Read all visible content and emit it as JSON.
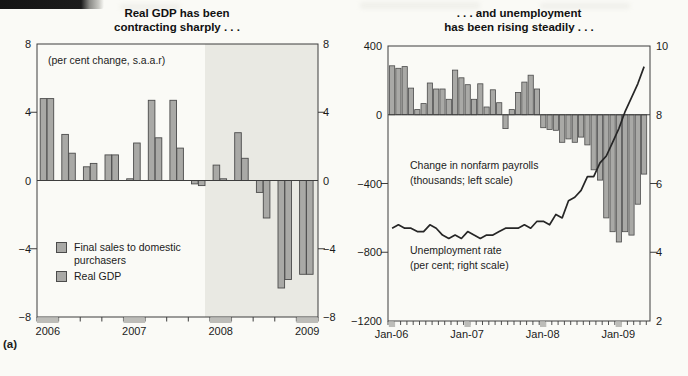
{
  "page": {
    "figure_label": "(a)"
  },
  "chart_data": [
    {
      "type": "bar",
      "panel": "left",
      "title": [
        "Real GDP has been",
        "contracting sharply . . ."
      ],
      "subtitle": "(per cent change, s.a.a.r)",
      "categories": [
        "2006 Q1",
        "2006 Q2",
        "2006 Q3",
        "2006 Q4",
        "2007 Q1",
        "2007 Q2",
        "2007 Q3",
        "2007 Q4",
        "2008 Q1",
        "2008 Q2",
        "2008 Q3",
        "2008 Q4",
        "2009 Q1"
      ],
      "series": [
        {
          "name": "Real GDP",
          "values": [
            4.8,
            2.7,
            0.8,
            1.5,
            0.1,
            4.7,
            4.7,
            -0.2,
            0.9,
            2.8,
            -0.7,
            -6.3,
            -5.5
          ]
        },
        {
          "name": "Final sales to domestic purchasers",
          "values": [
            4.8,
            1.6,
            1.0,
            1.5,
            2.2,
            2.5,
            1.9,
            -0.3,
            0.1,
            1.3,
            -2.2,
            -5.8,
            -5.5
          ]
        }
      ],
      "legend": [
        "Final sales to domestic purchasers",
        "Real GDP"
      ],
      "ylim": [
        -8,
        8
      ],
      "y_tick_values": [
        8,
        4,
        0,
        -4,
        -8
      ],
      "y_tick_labels": [
        "8",
        "4",
        "0",
        "−4",
        "−8"
      ],
      "y_axis_sides": "both",
      "x_axis_labels": [
        "2006",
        "2007",
        "2008",
        "2009"
      ],
      "shaded_span": {
        "from": "2008 Q1",
        "to": "2009 Q1",
        "note": "recession shading"
      },
      "grid": "off"
    },
    {
      "type": "bar+line",
      "panel": "right",
      "title": [
        ". . . and unemployment",
        "has been rising steadily . . ."
      ],
      "categories": [
        "Jan-06",
        "Feb-06",
        "Mar-06",
        "Apr-06",
        "May-06",
        "Jun-06",
        "Jul-06",
        "Aug-06",
        "Sep-06",
        "Oct-06",
        "Nov-06",
        "Dec-06",
        "Jan-07",
        "Feb-07",
        "Mar-07",
        "Apr-07",
        "May-07",
        "Jun-07",
        "Jul-07",
        "Aug-07",
        "Sep-07",
        "Oct-07",
        "Nov-07",
        "Dec-07",
        "Jan-08",
        "Feb-08",
        "Mar-08",
        "Apr-08",
        "May-08",
        "Jun-08",
        "Jul-08",
        "Aug-08",
        "Sep-08",
        "Oct-08",
        "Nov-08",
        "Dec-08",
        "Jan-09",
        "Feb-09",
        "Mar-09",
        "Apr-09",
        "May-09"
      ],
      "bar_series": {
        "name": "Change in nonfarm payrolls (thousands; left scale)",
        "values": [
          285,
          270,
          280,
          155,
          30,
          65,
          185,
          150,
          150,
          90,
          260,
          215,
          175,
          90,
          180,
          45,
          145,
          70,
          -80,
          30,
          130,
          190,
          230,
          150,
          -75,
          -85,
          -90,
          -160,
          -140,
          -160,
          -130,
          -175,
          -320,
          -380,
          -600,
          -680,
          -740,
          -680,
          -700,
          -520,
          -345
        ]
      },
      "line_series": {
        "name": "Unemployment rate (per cent; right scale)",
        "values": [
          4.7,
          4.8,
          4.7,
          4.7,
          4.6,
          4.6,
          4.8,
          4.7,
          4.5,
          4.4,
          4.5,
          4.4,
          4.6,
          4.5,
          4.4,
          4.5,
          4.5,
          4.6,
          4.7,
          4.7,
          4.7,
          4.8,
          4.7,
          4.9,
          4.9,
          4.8,
          5.1,
          5.0,
          5.5,
          5.6,
          5.8,
          6.2,
          6.2,
          6.6,
          6.8,
          7.2,
          7.6,
          8.1,
          8.5,
          8.9,
          9.4
        ]
      },
      "left_ylim": [
        -1200,
        400
      ],
      "left_tick_values": [
        400,
        0,
        -400,
        -800,
        -1200
      ],
      "left_tick_labels": [
        "400",
        "0",
        "−400",
        "−800",
        "−1200"
      ],
      "right_ylim": [
        2,
        10
      ],
      "right_tick_values": [
        10,
        8,
        6,
        4,
        2
      ],
      "right_tick_labels": [
        "10",
        "8",
        "6",
        "4",
        "2"
      ],
      "x_axis_labels": [
        "Jan-06",
        "Jan-07",
        "Jan-08",
        "Jan-09"
      ],
      "annotations": [
        "Change in nonfarm payrolls",
        "(thousands; left scale)",
        "Unemployment rate",
        "(per cent; right scale)"
      ],
      "grid": "off"
    }
  ],
  "colors": {
    "bar_fill": "#a9a9a6",
    "bar_stroke": "#4b4b4b",
    "axis": "#3d3d3d",
    "line_series": "#262626",
    "shading": "#e9e9e3",
    "year_block": "#bdbdb9",
    "page_background": "#fafaf6"
  }
}
